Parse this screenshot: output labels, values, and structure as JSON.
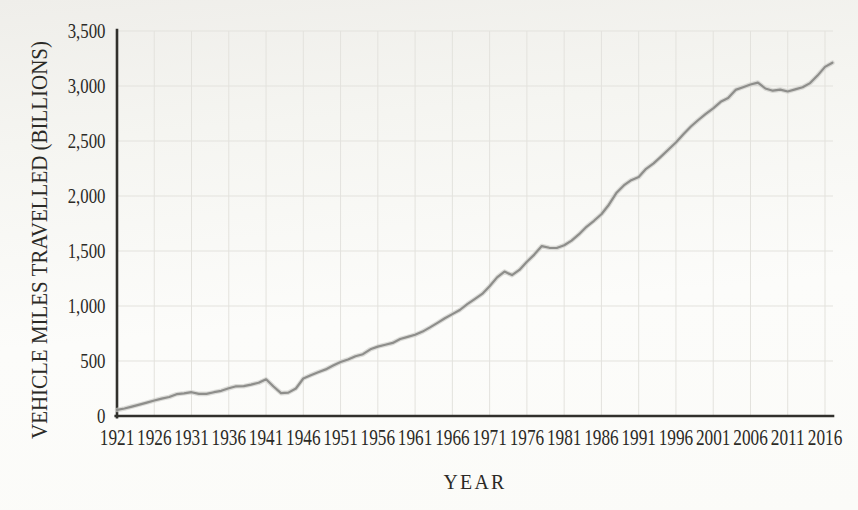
{
  "chart_data": {
    "type": "line",
    "title": "",
    "xlabel": "YEAR",
    "ylabel": "VEHICLE MILES TRAVELLED (BILLIONS)",
    "xlim": [
      1921,
      2017.5
    ],
    "ylim": [
      0,
      3500
    ],
    "grid": true,
    "legend": "none",
    "xticks": [
      1921,
      1926,
      1931,
      1936,
      1941,
      1946,
      1951,
      1956,
      1961,
      1966,
      1971,
      1976,
      1981,
      1986,
      1991,
      1996,
      2001,
      2006,
      2011,
      2016
    ],
    "yticks": [
      0,
      500,
      1000,
      1500,
      2000,
      2500,
      3000,
      3500
    ],
    "ytick_labels": [
      "0",
      "500",
      "1,000",
      "1,500",
      "2,000",
      "2,500",
      "3,000",
      "3,500"
    ],
    "line_color": "#8e8e8b",
    "axis_color": "#31302c",
    "grid_color": "#e3e2dd",
    "text_color": "#2b2a26",
    "series": [
      {
        "name": "Vehicle miles travelled (billions)",
        "years": [
          1921,
          1922,
          1923,
          1924,
          1925,
          1926,
          1927,
          1928,
          1929,
          1930,
          1931,
          1932,
          1933,
          1934,
          1935,
          1936,
          1937,
          1938,
          1939,
          1940,
          1941,
          1942,
          1943,
          1944,
          1945,
          1946,
          1947,
          1948,
          1949,
          1950,
          1951,
          1952,
          1953,
          1954,
          1955,
          1956,
          1957,
          1958,
          1959,
          1960,
          1961,
          1962,
          1963,
          1964,
          1965,
          1966,
          1967,
          1968,
          1969,
          1970,
          1971,
          1972,
          1973,
          1974,
          1975,
          1976,
          1977,
          1978,
          1979,
          1980,
          1981,
          1982,
          1983,
          1984,
          1985,
          1986,
          1987,
          1988,
          1989,
          1990,
          1991,
          1992,
          1993,
          1994,
          1995,
          1996,
          1997,
          1998,
          1999,
          2000,
          2001,
          2002,
          2003,
          2004,
          2005,
          2006,
          2007,
          2008,
          2009,
          2010,
          2011,
          2012,
          2013,
          2014,
          2015,
          2016,
          2017
        ],
        "values": [
          55,
          68,
          85,
          104,
          122,
          141,
          158,
          173,
          198,
          206,
          216,
          201,
          201,
          216,
          229,
          252,
          270,
          271,
          285,
          302,
          334,
          268,
          208,
          213,
          250,
          341,
          371,
          398,
          424,
          458,
          491,
          514,
          544,
          562,
          606,
          631,
          647,
          665,
          700,
          719,
          738,
          767,
          805,
          846,
          888,
          926,
          964,
          1016,
          1062,
          1110,
          1179,
          1260,
          1313,
          1281,
          1328,
          1402,
          1467,
          1545,
          1529,
          1527,
          1553,
          1595,
          1653,
          1720,
          1775,
          1835,
          1921,
          2026,
          2096,
          2144,
          2172,
          2247,
          2296,
          2358,
          2423,
          2486,
          2562,
          2632,
          2691,
          2747,
          2797,
          2856,
          2890,
          2965,
          2989,
          3014,
          3031,
          2977,
          2957,
          2967,
          2950,
          2969,
          2988,
          3026,
          3095,
          3174,
          3212
        ]
      }
    ]
  }
}
